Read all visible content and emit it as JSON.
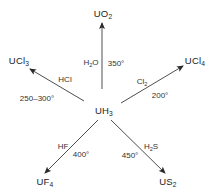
{
  "diagram": {
    "title": "",
    "center": {
      "id": "uh3",
      "base": "UH",
      "sub": "3",
      "x": 104,
      "y": 112
    },
    "colors": {
      "ink": "#222222",
      "line": "#3a3a3a",
      "background": "#ffffff"
    },
    "products": [
      {
        "id": "uo2",
        "base": "UO",
        "sub": "2",
        "x": 103,
        "y": 15
      },
      {
        "id": "ucl3",
        "base": "UCl",
        "sub": "3",
        "x": 19,
        "y": 62
      },
      {
        "id": "ucl4",
        "base": "UCl",
        "sub": "4",
        "x": 195,
        "y": 62
      },
      {
        "id": "uf4",
        "base": "UF",
        "sub": "4",
        "x": 45,
        "y": 183
      },
      {
        "id": "us2",
        "base": "US",
        "sub": "2",
        "x": 168,
        "y": 183
      }
    ],
    "reactions": [
      {
        "to": "uo2",
        "reagent_base": "H",
        "reagent_sub": "2",
        "reagent_tail": "O",
        "temperature": "350°",
        "arrow": {
          "x1": 102,
          "y1": 89,
          "x2": 102,
          "y2": 23
        }
      },
      {
        "to": "ucl3",
        "reagent_base": "HCl",
        "reagent_sub": "",
        "reagent_tail": "",
        "temperature": "250–300°",
        "arrow": {
          "x1": 84,
          "y1": 101,
          "x2": 30,
          "y2": 69
        }
      },
      {
        "to": "ucl4",
        "reagent_base": "Cl",
        "reagent_sub": "2",
        "reagent_tail": "",
        "temperature": "200°",
        "arrow": {
          "x1": 121,
          "y1": 103,
          "x2": 183,
          "y2": 66
        }
      },
      {
        "to": "uf4",
        "reagent_base": "HF",
        "reagent_sub": "",
        "reagent_tail": "",
        "temperature": "400°",
        "arrow": {
          "x1": 98,
          "y1": 120,
          "x2": 45,
          "y2": 173
        }
      },
      {
        "to": "us2",
        "reagent_base": "H",
        "reagent_sub": "2",
        "reagent_tail": "S",
        "temperature": "450°",
        "arrow": {
          "x1": 111,
          "y1": 120,
          "x2": 165,
          "y2": 173
        }
      }
    ],
    "labels": {
      "uo2_reagent": {
        "x": 91,
        "y": 64
      },
      "uo2_temp": {
        "x": 116,
        "y": 64
      },
      "ucl3_reagent": {
        "x": 65,
        "y": 80
      },
      "ucl3_temp": {
        "x": 37,
        "y": 99
      },
      "ucl4_reagent": {
        "x": 142,
        "y": 83
      },
      "ucl4_temp": {
        "x": 160,
        "y": 96
      },
      "uf4_reagent": {
        "x": 63,
        "y": 147
      },
      "uf4_temp": {
        "x": 81,
        "y": 155
      },
      "us2_reagent": {
        "x": 151,
        "y": 148
      },
      "us2_temp": {
        "x": 130,
        "y": 156
      }
    }
  }
}
